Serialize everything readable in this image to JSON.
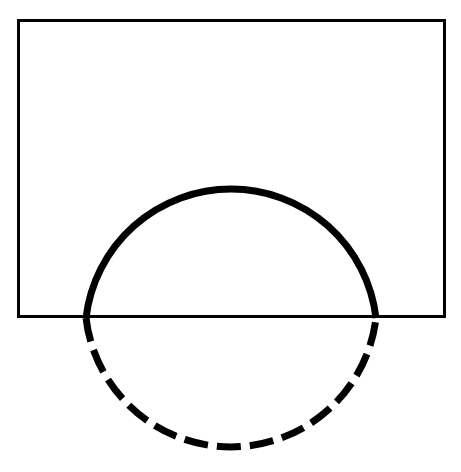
{
  "page": {
    "width": 461,
    "height": 472,
    "background_color": "#ffffff"
  },
  "figure": {
    "type": "line-drawing",
    "stroke_color": "#000000",
    "fill_color": "none",
    "shapes": [
      {
        "name": "rectangle",
        "kind": "rect",
        "x": 17,
        "y": 19,
        "width": 429,
        "height": 299,
        "stroke_width": 3,
        "stroke_color": "#000000",
        "fill": "none",
        "line_style": "solid"
      },
      {
        "name": "circle-upper-arc",
        "kind": "arc",
        "center_x": 231,
        "center_y": 301,
        "radius": 146,
        "stroke_width": 7,
        "stroke_color": "#000000",
        "line_style": "solid",
        "start_angle_deg": 186.7,
        "end_angle_deg": 353.3,
        "region": "inside-rectangle"
      },
      {
        "name": "circle-lower-arc",
        "kind": "arc",
        "center_x": 231,
        "center_y": 301,
        "radius": 146,
        "stroke_width": 7,
        "stroke_color": "#000000",
        "line_style": "dashed",
        "dash_length": 24,
        "gap_length": 9,
        "start_angle_deg": 6.7,
        "end_angle_deg": 173.3,
        "region": "outside-rectangle"
      }
    ],
    "chord_line": {
      "name": "rectangle-bottom-edge",
      "y": 318,
      "x_start": 17,
      "x_end": 446,
      "circle_intersection_left_x": 86,
      "circle_intersection_right_x": 376
    }
  }
}
